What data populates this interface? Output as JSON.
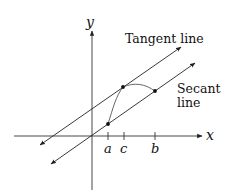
{
  "diagram": {
    "axes": {
      "x_label": "x",
      "y_label": "y"
    },
    "tick_labels": [
      "a",
      "c",
      "b"
    ],
    "line_labels": {
      "tangent": "Tangent line",
      "secant_line1": "Secant",
      "secant_line2": "line"
    },
    "points": [
      {
        "name": "a",
        "label": "point at a"
      },
      {
        "name": "c",
        "label": "point of tangency at c"
      },
      {
        "name": "b",
        "label": "point at b"
      }
    ],
    "colors": {
      "stroke": "#222222",
      "curve": "#555555",
      "background": "#ffffff"
    }
  }
}
